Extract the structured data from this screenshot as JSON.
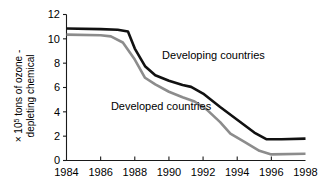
{
  "chart_data": {
    "type": "line",
    "title": "",
    "subtitle": "",
    "xlabel": "",
    "ylabel_line1": "× 10",
    "ylabel_exponent": "5",
    "ylabel_line1_rest": " tons of ozone -",
    "ylabel_line2": "depleting chemical",
    "xlim": [
      1984,
      1998
    ],
    "ylim": [
      0,
      12
    ],
    "grid": false,
    "legend_position": "inline-annotations",
    "x_ticks": [
      1984,
      1986,
      1988,
      1990,
      1992,
      1994,
      1996,
      1998
    ],
    "x_tick_labels": [
      "1984",
      "1986",
      "1988",
      "1990",
      "1992",
      "1994",
      "1996",
      "1998"
    ],
    "y_ticks": [
      0,
      2,
      4,
      6,
      8,
      10,
      12
    ],
    "y_tick_labels": [
      "0",
      "2",
      "4",
      "6",
      "8",
      "10",
      "12"
    ],
    "series": [
      {
        "name": "Developing countries",
        "color": "#111111",
        "width": 2.6,
        "label_x": 1989.6,
        "label_y": 8.35,
        "x": [
          1984,
          1986,
          1987.0,
          1987.6,
          1988.0,
          1988.6,
          1989.2,
          1990.0,
          1990.8,
          1991.3,
          1992.0,
          1993.0,
          1994.0,
          1995.0,
          1995.7,
          1996.6,
          1998
        ],
        "values": [
          10.85,
          10.8,
          10.75,
          10.6,
          9.2,
          7.75,
          7.0,
          6.55,
          6.2,
          6.05,
          5.5,
          4.4,
          3.35,
          2.3,
          1.75,
          1.75,
          1.8
        ]
      },
      {
        "name": "Developed countries",
        "color": "#8c8c8c",
        "width": 2.6,
        "label_x": 1986.6,
        "label_y": 4.15,
        "x": [
          1984,
          1986,
          1986.6,
          1987.3,
          1988.0,
          1988.6,
          1989.2,
          1990.0,
          1990.8,
          1991.5,
          1992.2,
          1993.0,
          1993.6,
          1994.4,
          1995.3,
          1996.0,
          1998
        ],
        "values": [
          10.35,
          10.3,
          10.2,
          9.7,
          8.3,
          6.8,
          6.25,
          5.65,
          5.2,
          4.85,
          4.2,
          3.15,
          2.2,
          1.55,
          0.8,
          0.5,
          0.55
        ]
      }
    ]
  },
  "annotations": [
    {
      "text": "Developing countries"
    },
    {
      "text": "Developed countries"
    }
  ]
}
